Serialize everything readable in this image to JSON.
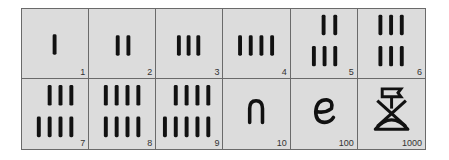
{
  "colors": {
    "cell_bg": "#dcdcdc",
    "border": "#6a6a6a",
    "ink": "#111111",
    "label": "#333333"
  },
  "cells": [
    {
      "value": "1",
      "glyph": "one-stroke"
    },
    {
      "value": "2",
      "glyph": "two-strokes"
    },
    {
      "value": "3",
      "glyph": "three-strokes"
    },
    {
      "value": "4",
      "glyph": "four-strokes"
    },
    {
      "value": "5",
      "glyph": "five-strokes"
    },
    {
      "value": "6",
      "glyph": "six-strokes"
    },
    {
      "value": "7",
      "glyph": "seven-strokes"
    },
    {
      "value": "8",
      "glyph": "eight-strokes"
    },
    {
      "value": "9",
      "glyph": "nine-strokes"
    },
    {
      "value": "10",
      "glyph": "heel-bone"
    },
    {
      "value": "100",
      "glyph": "coil-of-rope"
    },
    {
      "value": "1000",
      "glyph": "lotus-plant"
    }
  ]
}
